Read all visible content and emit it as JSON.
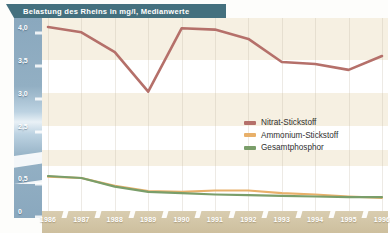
{
  "title": "Belastung des Rheins in mg/l, Medianwerte",
  "colors": {
    "nitrat": "#b5706a",
    "ammonium": "#e8b06a",
    "phosphor": "#7a9e6a",
    "banner": "#44707e",
    "axis": "#8aa8be",
    "xaxis": "#cdbf9e",
    "band": "#f6f0e2"
  },
  "y_axis": {
    "ticks_upper": [
      "4,0",
      "3,5",
      "3,0",
      "2,5"
    ],
    "ticks_lower": [
      "0,5",
      "0"
    ],
    "has_break": true
  },
  "legend": {
    "items": [
      {
        "label": "Nitrat-Stickstoff",
        "color": "#b5706a"
      },
      {
        "label": "Ammonium-Stickstoff",
        "color": "#e8b06a"
      },
      {
        "label": "Gesamtphosphor",
        "color": "#7a9e6a"
      }
    ]
  },
  "chart_data": {
    "type": "line",
    "title": "Belastung des Rheins in mg/l, Medianwerte",
    "xlabel": "",
    "ylabel": "mg/l",
    "grid": true,
    "legend_position": "center-right",
    "axis_break": {
      "from": 2.5,
      "to": 0.75
    },
    "ylim_upper": [
      2.5,
      4.0
    ],
    "ylim_lower": [
      0,
      0.75
    ],
    "categories": [
      "1986",
      "1987",
      "1988",
      "1989",
      "1990",
      "1991",
      "1992",
      "1993",
      "1994",
      "1995",
      "1996"
    ],
    "series": [
      {
        "name": "Nitrat-Stickstoff",
        "color": "#b5706a",
        "values": [
          4.0,
          3.92,
          3.62,
          3.02,
          3.98,
          3.96,
          3.82,
          3.47,
          3.44,
          3.35,
          3.56
        ]
      },
      {
        "name": "Ammonium-Stickstoff",
        "color": "#e8b06a",
        "values": [
          0.52,
          0.5,
          0.38,
          0.3,
          0.29,
          0.31,
          0.31,
          0.27,
          0.25,
          0.22,
          0.2
        ]
      },
      {
        "name": "Gesamtphosphor",
        "color": "#7a9e6a",
        "values": [
          0.53,
          0.5,
          0.37,
          0.29,
          0.27,
          0.25,
          0.24,
          0.23,
          0.22,
          0.21,
          0.21
        ]
      }
    ]
  }
}
